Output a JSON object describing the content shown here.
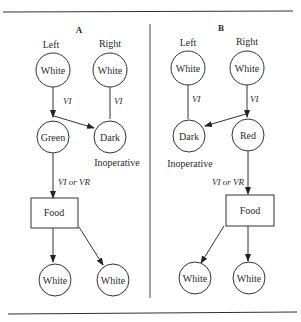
{
  "panels": {
    "A": {
      "title": "A",
      "left_label": "Left",
      "right_label": "Right",
      "top_left_node": "White",
      "top_right_node": "White",
      "mid_left_node": "Green",
      "mid_right_node": "Dark",
      "mid_right_note": "Inoperative",
      "left_edge_label": "VI",
      "right_edge_label": "VI",
      "food_edge_label": "VI or VR",
      "food_box": "Food",
      "bottom_left_node": "White",
      "bottom_right_node": "White"
    },
    "B": {
      "title": "B",
      "left_label": "Left",
      "right_label": "Right",
      "top_left_node": "White",
      "top_right_node": "White",
      "mid_left_node": "Dark",
      "mid_right_node": "Red",
      "mid_left_note": "Inoperative",
      "left_edge_label": "VI",
      "right_edge_label": "VI",
      "food_edge_label": "VI or VR",
      "food_box": "Food",
      "bottom_left_node": "White",
      "bottom_right_node": "White"
    }
  }
}
